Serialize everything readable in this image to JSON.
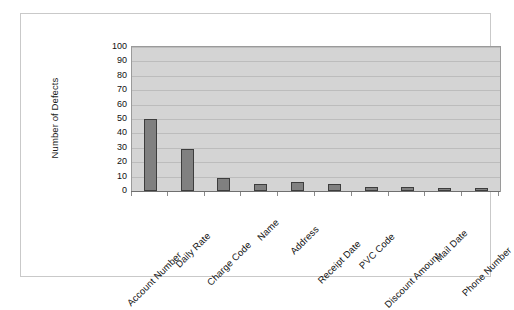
{
  "chart_data": {
    "type": "bar",
    "title": "",
    "xlabel": "",
    "ylabel": "Number of Defects",
    "ylim": [
      0,
      100
    ],
    "ytick_step": 10,
    "yticks": [
      100,
      90,
      80,
      70,
      60,
      50,
      40,
      30,
      20,
      10,
      0
    ],
    "grid": true,
    "legend": "none",
    "categories": [
      "Account Number",
      "Daily Rate",
      "Charge Code",
      "Name",
      "Address",
      "Receipt Date",
      "PVC Code",
      "Discount Amount",
      "Mail Date",
      "Phone Number"
    ],
    "values": [
      50,
      29,
      9,
      5,
      6,
      5,
      3,
      3,
      2,
      2
    ],
    "series": [
      {
        "name": "Defects",
        "values": [
          50,
          29,
          9,
          5,
          6,
          5,
          3,
          3,
          2,
          2
        ]
      }
    ],
    "colors": {
      "bar_fill": "#808080",
      "bar_border": "#3d3d3d",
      "plot_background": "#d4d4d4",
      "gridline": "#bcbcbc",
      "plot_border": "#9a9a9a",
      "frame_border": "#c9c9c9",
      "page_background": "#ffffff",
      "text": "#141414"
    }
  }
}
